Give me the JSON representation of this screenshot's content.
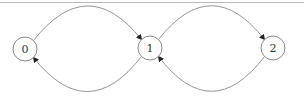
{
  "diagram": {
    "type": "state-graph",
    "nodes": [
      {
        "id": "0",
        "label": "0"
      },
      {
        "id": "1",
        "label": "1"
      },
      {
        "id": "2",
        "label": "2"
      }
    ],
    "edges": [
      {
        "from": "0",
        "to": "1",
        "curve": "top"
      },
      {
        "from": "1",
        "to": "0",
        "curve": "bottom"
      },
      {
        "from": "1",
        "to": "2",
        "curve": "top"
      },
      {
        "from": "2",
        "to": "1",
        "curve": "bottom"
      }
    ],
    "colors": {
      "node_stroke": "#777777",
      "edge_stroke": "#888888",
      "label": "#333333",
      "border": "#b8b8b8"
    }
  }
}
